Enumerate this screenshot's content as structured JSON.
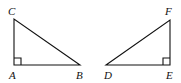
{
  "figure": {
    "triangles": [
      {
        "name": "ABC",
        "right_angle_at": "A",
        "vertices": {
          "A": "A",
          "B": "B",
          "C": "C"
        }
      },
      {
        "name": "DEF",
        "right_angle_at": "E",
        "vertices": {
          "D": "D",
          "E": "E",
          "F": "F"
        }
      }
    ],
    "colors": {
      "stroke": "#111111",
      "background": "#ffffff"
    }
  }
}
